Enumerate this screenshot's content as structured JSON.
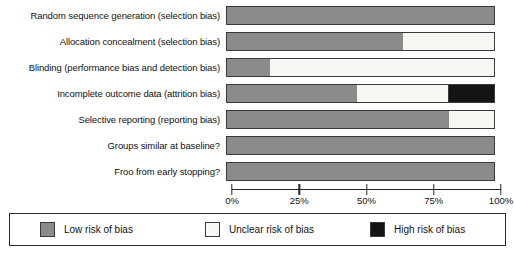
{
  "chart_data": {
    "type": "bar",
    "orientation": "horizontal",
    "stacked": true,
    "title": "",
    "xlabel": "",
    "ylabel": "",
    "xlim": [
      0,
      100
    ],
    "grid": false,
    "legend_position": "bottom",
    "x_ticks": [
      "0%",
      "25%",
      "50%",
      "75%",
      "100%"
    ],
    "x_tick_values": [
      0,
      25,
      50,
      75,
      100
    ],
    "categories": [
      "Random sequence generation (selection bias)",
      "Allocation concealment (selection bias)",
      "Blinding (performance bias and detection bias)",
      "Incomplete outcome data (attrition bias)",
      "Selective reporting (reporting bias)",
      "Groups similar at baseline?",
      "Froo from early stopping?"
    ],
    "series": [
      {
        "name": "Low risk of bias",
        "color": "#8b8b8b",
        "values": [
          100,
          66,
          16,
          49,
          83,
          100,
          100
        ]
      },
      {
        "name": "Unclear risk of bias",
        "color": "#f7f7f4",
        "values": [
          0,
          34,
          84,
          34,
          17,
          0,
          0
        ]
      },
      {
        "name": "High risk of bias",
        "color": "#141414",
        "values": [
          0,
          0,
          0,
          17,
          0,
          0,
          0
        ]
      }
    ]
  },
  "legend": {
    "items": [
      {
        "label": "Low risk of bias",
        "swatch": "low"
      },
      {
        "label": "Unclear risk of bias",
        "swatch": "unclear"
      },
      {
        "label": "High risk of bias",
        "swatch": "high"
      }
    ]
  },
  "colors": {
    "low": "#8b8b8b",
    "unclear": "#f7f7f4",
    "high": "#141414",
    "outline": "#3a3a3a",
    "text": "#121212"
  }
}
